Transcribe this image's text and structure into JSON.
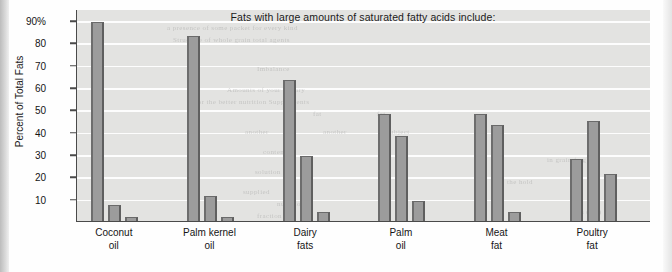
{
  "chart_data": {
    "type": "bar",
    "title": "Fats with large amounts of saturated fatty acids include:",
    "xlabel": "",
    "ylabel": "Percent of Total Fats",
    "ylim": [
      0,
      95
    ],
    "grid": true,
    "legend": "none",
    "ytick_labels": [
      "90%",
      "80",
      "70",
      "60",
      "50",
      "40",
      "30",
      "20",
      "10"
    ],
    "ytick_values": [
      90,
      80,
      70,
      60,
      50,
      40,
      30,
      20,
      10
    ],
    "categories": [
      "Coconut oil",
      "Palm kernel oil",
      "Dairy fats",
      "Palm oil",
      "Meat fat",
      "Poultry fat"
    ],
    "category_lines": [
      [
        "Coconut",
        "oil"
      ],
      [
        "Palm kernel",
        "oil"
      ],
      [
        "Dairy",
        "fats"
      ],
      [
        "Palm",
        "oil"
      ],
      [
        "Meat",
        "fat"
      ],
      [
        "Poultry",
        "fat"
      ]
    ],
    "series": [
      {
        "name": "Saturated",
        "values": [
          89,
          83,
          63,
          48,
          48,
          28
        ]
      },
      {
        "name": "Monounsaturated",
        "values": [
          7,
          11,
          29,
          38,
          43,
          45
        ]
      },
      {
        "name": "Polyunsaturated",
        "values": [
          2,
          2,
          4,
          9,
          4,
          21
        ]
      }
    ],
    "bar_color": "#9c9c9c",
    "plot_background": "#e3e3e1",
    "axis_color": "#4a4a4a"
  },
  "ghost_text": [
    {
      "text": "a presence of some packet for every kind",
      "x": 90,
      "y": 14
    },
    {
      "text": "Structure of whole grain total agents",
      "x": 96,
      "y": 26
    },
    {
      "text": "Imbalance",
      "x": 180,
      "y": 55
    },
    {
      "text": "Amounts of your dietary",
      "x": 150,
      "y": 76
    },
    {
      "text": "for the better nutrition Supplements",
      "x": 118,
      "y": 88
    },
    {
      "text": "fat",
      "x": 236,
      "y": 100
    },
    {
      "text": "fat",
      "x": 300,
      "y": 100
    },
    {
      "text": "another",
      "x": 168,
      "y": 118
    },
    {
      "text": "another",
      "x": 246,
      "y": 118
    },
    {
      "text": "subject",
      "x": 310,
      "y": 118
    },
    {
      "text": "content",
      "x": 186,
      "y": 138
    },
    {
      "text": "solution",
      "x": 178,
      "y": 158
    },
    {
      "text": "supplied",
      "x": 166,
      "y": 178
    },
    {
      "text": "nutrition",
      "x": 200,
      "y": 190
    },
    {
      "text": "fraction",
      "x": 180,
      "y": 202
    },
    {
      "text": "in grain (mg)",
      "x": 470,
      "y": 146
    },
    {
      "text": "the hold",
      "x": 430,
      "y": 168
    },
    {
      "text": "ks (mg)",
      "x": 500,
      "y": 198
    },
    {
      "text": "on the",
      "x": 440,
      "y": 212
    }
  ]
}
